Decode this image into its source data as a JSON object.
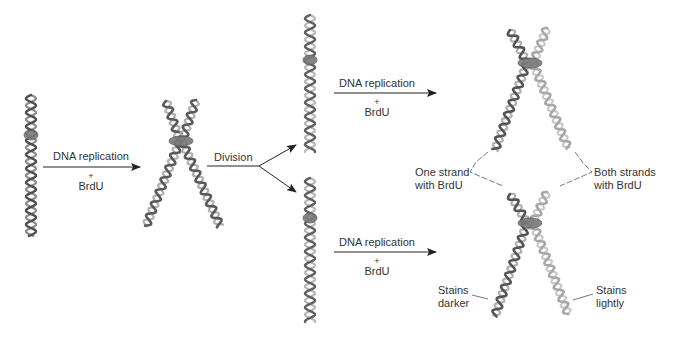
{
  "diagram": {
    "title": "",
    "colors": {
      "dark_strand": "#5a5a5a",
      "light_strand": "#b4b4b4",
      "mid_strand": "#8a8a8a",
      "arrow": "#222222",
      "label": "#333333",
      "leader": "#555555"
    },
    "arrows": [
      {
        "id": "replication-1",
        "label_top": "DNA replication",
        "plus": "+",
        "label_bottom": "BrdU"
      },
      {
        "id": "division",
        "label_top": "Division"
      },
      {
        "id": "replication-2-top",
        "label_top": "DNA replication",
        "plus": "+",
        "label_bottom": "BrdU"
      },
      {
        "id": "replication-2-bottom",
        "label_top": "DNA replication",
        "plus": "+",
        "label_bottom": "BrdU"
      }
    ],
    "callouts": {
      "one_strand": [
        "One strand",
        "with BrdU"
      ],
      "both_strands": [
        "Both strands",
        "with BrdU"
      ],
      "stains_darker": [
        "Stains",
        "darker"
      ],
      "stains_lightly": [
        "Stains",
        "lightly"
      ]
    },
    "stages": [
      {
        "name": "original-chromosome",
        "description": "single unreplicated chromosome"
      },
      {
        "name": "replicated-chromatids",
        "description": "two sister chromatids joined at centromere"
      },
      {
        "name": "daughter-chromosome-top",
        "description": "chromosome after division"
      },
      {
        "name": "daughter-chromosome-bottom",
        "description": "chromosome after division"
      },
      {
        "name": "second-replication-top",
        "description": "sister chromatids, one dark one light"
      },
      {
        "name": "second-replication-bottom",
        "description": "sister chromatids, one dark one light"
      }
    ]
  }
}
